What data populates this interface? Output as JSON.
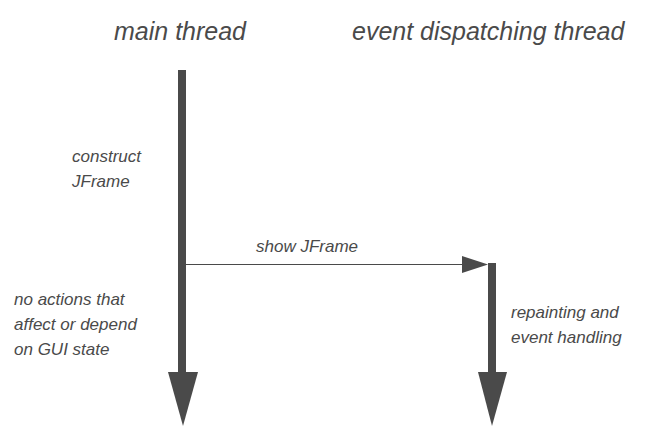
{
  "diagram": {
    "colors": {
      "arrow": "#4a4a4a",
      "text": "#4a4a4a",
      "background": "#ffffff"
    },
    "lanes": [
      {
        "id": "main",
        "title": "main thread"
      },
      {
        "id": "edt",
        "title": "event dispatching thread"
      }
    ],
    "notes": {
      "construct": "construct\nJFrame",
      "no_actions": "no actions that\naffect or depend\non GUI state",
      "repainting": "repainting and\nevent handling"
    },
    "messages": [
      {
        "from": "main",
        "to": "edt",
        "label": "show JFrame"
      }
    ]
  }
}
